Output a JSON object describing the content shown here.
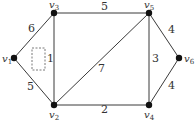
{
  "graph": {
    "nodes": [
      {
        "id": "v1",
        "name": "v",
        "sub": "1",
        "x": 14,
        "y": 58,
        "lx": 2,
        "ly": 62
      },
      {
        "id": "v2",
        "name": "v",
        "sub": "2",
        "x": 54,
        "y": 105,
        "lx": 49,
        "ly": 118
      },
      {
        "id": "v3",
        "name": "v",
        "sub": "3",
        "x": 54,
        "y": 13,
        "lx": 49,
        "ly": 8
      },
      {
        "id": "v4",
        "name": "v",
        "sub": "4",
        "x": 149,
        "y": 105,
        "lx": 144,
        "ly": 118
      },
      {
        "id": "v5",
        "name": "v",
        "sub": "5",
        "x": 149,
        "y": 13,
        "lx": 144,
        "ly": 8
      },
      {
        "id": "v6",
        "name": "v",
        "sub": "6",
        "x": 179,
        "y": 58,
        "lx": 184,
        "ly": 62
      }
    ],
    "edges": [
      {
        "from": "v1",
        "to": "v3",
        "weight": "6",
        "lx": 28,
        "ly": 32
      },
      {
        "from": "v1",
        "to": "v2",
        "weight": "5",
        "lx": 27,
        "ly": 90
      },
      {
        "from": "v3",
        "to": "v2",
        "weight": "1",
        "lx": 47,
        "ly": 62
      },
      {
        "from": "v3",
        "to": "v5",
        "weight": "5",
        "lx": 101,
        "ly": 10
      },
      {
        "from": "v2",
        "to": "v5",
        "weight": "7",
        "lx": 98,
        "ly": 72
      },
      {
        "from": "v2",
        "to": "v4",
        "weight": "2",
        "lx": 101,
        "ly": 113
      },
      {
        "from": "v5",
        "to": "v4",
        "weight": "3",
        "lx": 152,
        "ly": 62
      },
      {
        "from": "v5",
        "to": "v6",
        "weight": "4",
        "lx": 168,
        "ly": 33
      },
      {
        "from": "v6",
        "to": "v4",
        "weight": "4",
        "lx": 168,
        "ly": 89
      }
    ],
    "dashed_box": {
      "x": 32,
      "y": 48,
      "w": 13,
      "h": 22
    }
  }
}
